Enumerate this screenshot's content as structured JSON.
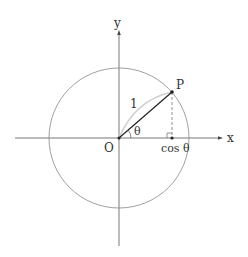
{
  "diagram": {
    "labels": {
      "x_axis": "x",
      "y_axis": "y",
      "origin": "O",
      "point": "P",
      "radius": "1",
      "angle": "θ",
      "projection": "cos θ"
    },
    "colors": {
      "axis": "#555555",
      "circle": "#888888",
      "radius_line": "#222222",
      "arc": "#cfcfcf",
      "dashed": "#777777",
      "text": "#333333"
    }
  }
}
